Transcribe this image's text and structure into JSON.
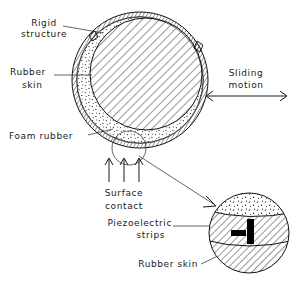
{
  "figure": {
    "background_color": "#ffffff",
    "line_color": "#111111"
  },
  "labels": {
    "rigid_structure_line1": "Rigid",
    "rigid_structure_line2": "structure",
    "rubber_skin_line1": "Rubber",
    "rubber_skin_line2": "skin",
    "foam_rubber": "Foam rubber",
    "sliding_motion_line1": "Sliding",
    "sliding_motion_line2": "motion",
    "surface_contact_line1": "Surface",
    "surface_contact_line2": "contact",
    "piezoelectric_line1": "Piezoelectric",
    "piezoelectric_line2": "strips",
    "detail_rubber_skin": "Rubber skin"
  },
  "main_assembly": {
    "rigid_core": {
      "shape": "circle",
      "center_x": 146,
      "center_y": 74,
      "radius": 56,
      "fill_pattern": "diagonal-hatch"
    },
    "foam_layer": {
      "shape": "circle",
      "center_x": 140,
      "center_y": 80,
      "radius": 64,
      "fill_pattern": "stipple-dots"
    },
    "rubber_skin_layer": {
      "shape": "circle",
      "center_x": 140,
      "center_y": 80,
      "radius": 68,
      "fill_pattern": "cross-hatch-band"
    },
    "contact_callout": {
      "shape": "circle",
      "center_x": 129,
      "center_y": 148,
      "radius": 17
    }
  },
  "detail_inset": {
    "center_x": 249,
    "center_y": 233,
    "radius": 40,
    "bands": [
      {
        "name": "foam-rubber-band",
        "pattern": "stipple-dots"
      },
      {
        "name": "piezoelectric-band",
        "pattern": "diagonal-hatch"
      },
      {
        "name": "rubber-skin-band",
        "pattern": "diagonal-hatch"
      }
    ],
    "strips": [
      {
        "name": "horizontal-strip",
        "x": 231,
        "y": 230,
        "width": 15,
        "height": 6
      },
      {
        "name": "vertical-strip",
        "x": 247,
        "y": 219,
        "width": 7,
        "height": 25
      }
    ]
  },
  "arrows": {
    "sliding_motion": {
      "type": "double-headed-horizontal",
      "x1": 205,
      "x2": 288,
      "y": 96
    },
    "surface_contact": {
      "type": "three-up-arrows",
      "positions": [
        109,
        124,
        139
      ],
      "y_top": 158,
      "y_bottom": 182
    }
  }
}
